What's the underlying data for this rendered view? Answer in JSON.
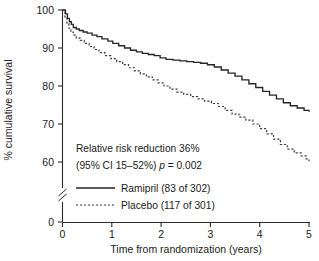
{
  "chart_data": {
    "type": "line",
    "title": "",
    "subtitle": "",
    "xlabel": "Time from randomization (years)",
    "ylabel": "% cumulative survival",
    "xlim": [
      0,
      5
    ],
    "ylim": [
      55,
      100
    ],
    "y_axis_break": {
      "present": true,
      "break_between": [
        0,
        55
      ],
      "zero_label": "0"
    },
    "grid": false,
    "legend_position": "inside-lower-left",
    "xticks": [
      0,
      1,
      2,
      3,
      4,
      5
    ],
    "xtick_labels": [
      "0",
      "1",
      "2",
      "3",
      "4",
      "5"
    ],
    "yticks": [
      60,
      70,
      80,
      90,
      100
    ],
    "ytick_labels": [
      "60",
      "70",
      "80",
      "90",
      "100"
    ],
    "series": [
      {
        "name": "Ramipril (83 of 302)",
        "style": "solid",
        "color": "#262626",
        "x": [
          0.0,
          0.06,
          0.1,
          0.14,
          0.18,
          0.22,
          0.28,
          0.34,
          0.42,
          0.5,
          0.6,
          0.7,
          0.8,
          0.92,
          1.02,
          1.14,
          1.26,
          1.38,
          1.5,
          1.62,
          1.74,
          1.86,
          1.98,
          2.1,
          2.24,
          2.38,
          2.52,
          2.66,
          2.8,
          2.94,
          3.08,
          3.22,
          3.36,
          3.5,
          3.64,
          3.78,
          3.92,
          4.06,
          4.2,
          4.34,
          4.48,
          4.62,
          4.76,
          4.9,
          5.0
        ],
        "y": [
          100.0,
          99.0,
          97.8,
          96.9,
          96.2,
          95.4,
          95.0,
          94.6,
          94.2,
          93.9,
          93.4,
          93.0,
          92.4,
          91.8,
          91.2,
          90.6,
          90.0,
          89.4,
          89.0,
          88.6,
          88.3,
          88.0,
          87.4,
          87.0,
          86.8,
          86.6,
          86.4,
          86.2,
          86.0,
          85.6,
          85.0,
          84.2,
          83.4,
          82.6,
          81.6,
          80.6,
          79.6,
          78.6,
          77.6,
          76.6,
          75.6,
          74.8,
          74.2,
          73.6,
          73.2
        ]
      },
      {
        "name": "Placebo (117 of 301)",
        "style": "dotted",
        "color": "#3a3a3a",
        "x": [
          0.0,
          0.05,
          0.09,
          0.13,
          0.17,
          0.22,
          0.28,
          0.36,
          0.44,
          0.54,
          0.64,
          0.74,
          0.86,
          0.98,
          1.1,
          1.22,
          1.34,
          1.46,
          1.58,
          1.7,
          1.82,
          1.94,
          2.06,
          2.18,
          2.32,
          2.46,
          2.6,
          2.74,
          2.88,
          3.02,
          3.16,
          3.3,
          3.44,
          3.58,
          3.72,
          3.86,
          4.0,
          4.14,
          4.28,
          4.42,
          4.56,
          4.7,
          4.84,
          4.94,
          5.0
        ],
        "y": [
          100.0,
          98.2,
          96.4,
          95.2,
          94.2,
          93.4,
          92.6,
          92.0,
          91.2,
          90.4,
          89.6,
          88.8,
          88.0,
          87.2,
          86.4,
          85.6,
          84.8,
          84.0,
          83.2,
          82.4,
          81.6,
          80.8,
          80.0,
          79.2,
          78.4,
          77.8,
          77.2,
          76.6,
          76.0,
          75.4,
          74.6,
          73.6,
          72.6,
          71.8,
          71.0,
          70.0,
          68.8,
          67.4,
          66.0,
          64.6,
          63.4,
          62.4,
          61.6,
          60.8,
          60.2
        ]
      }
    ],
    "annotations": [
      {
        "text": "Relative risk reduction 36%"
      },
      {
        "text_prefix": "(95% CI 15–52%) ",
        "text_italic": "p",
        "text_suffix": " = 0.002"
      }
    ]
  },
  "legend": {
    "entries": [
      {
        "label": "Ramipril (83 of 302)",
        "style": "solid"
      },
      {
        "label": "Placebo (117 of 301)",
        "style": "dotted"
      }
    ]
  }
}
